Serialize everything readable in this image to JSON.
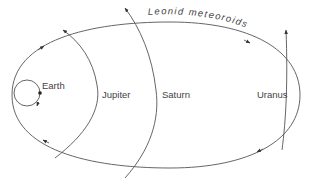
{
  "diagram": {
    "title": "Leonid meteoroids",
    "bodies": [
      {
        "name": "Earth",
        "label": "Earth"
      },
      {
        "name": "Jupiter",
        "label": "Jupiter"
      },
      {
        "name": "Saturn",
        "label": "Saturn"
      },
      {
        "name": "Uranus",
        "label": "Uranus"
      }
    ],
    "colors": {
      "line": "#555555",
      "text": "#444444",
      "background": "#ffffff"
    }
  }
}
